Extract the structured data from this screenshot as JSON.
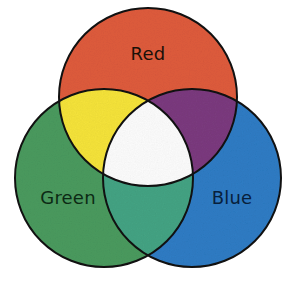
{
  "diagram": {
    "type": "venn",
    "background_color": "#FFFFFF",
    "outline_color": "#111111",
    "outline_width": 2,
    "texture": "print-halftone-grain",
    "canvas": {
      "width": 295,
      "height": 285
    },
    "sets": [
      {
        "id": "red",
        "label": "Red",
        "fill_color": "#DE5B3C",
        "label_color": "#1A1008",
        "center": {
          "x": 148,
          "y": 97
        },
        "radius": 89,
        "label_position": {
          "x": 148,
          "y": 55
        }
      },
      {
        "id": "green",
        "label": "Green",
        "fill_color": "#4A9A5E",
        "label_color": "#0C2A14",
        "center": {
          "x": 104,
          "y": 178
        },
        "radius": 89,
        "label_position": {
          "x": 68,
          "y": 199
        }
      },
      {
        "id": "blue",
        "label": "Blue",
        "fill_color": "#2E7CC4",
        "label_color": "#08203C",
        "center": {
          "x": 192,
          "y": 178
        },
        "radius": 89,
        "label_position": {
          "x": 232,
          "y": 199
        }
      }
    ],
    "intersections": [
      {
        "id": "red-green",
        "sets": [
          "red",
          "green"
        ],
        "result_color_name": "Yellow",
        "fill_color": "#F5E33A"
      },
      {
        "id": "red-blue",
        "sets": [
          "red",
          "blue"
        ],
        "result_color_name": "Magenta",
        "fill_color": "#7B3A7E"
      },
      {
        "id": "green-blue",
        "sets": [
          "green",
          "blue"
        ],
        "result_color_name": "Cyan",
        "fill_color": "#44A383"
      },
      {
        "id": "red-green-blue",
        "sets": [
          "red",
          "green",
          "blue"
        ],
        "result_color_name": "White",
        "fill_color": "#FCFCFC"
      }
    ]
  }
}
